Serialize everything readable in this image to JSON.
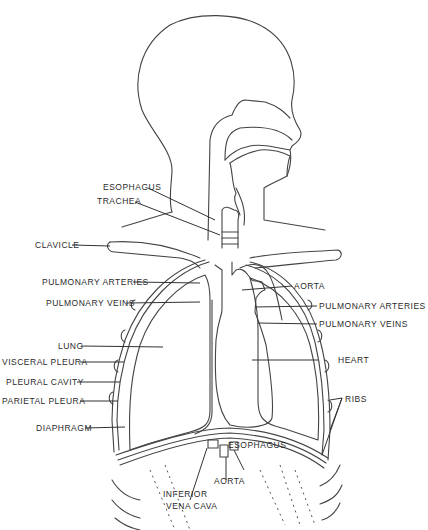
{
  "diagram": {
    "labels": {
      "esophagus_top": "ESOPHAGUS",
      "trachea": "TRACHEA",
      "clavicle": "CLAVICLE",
      "pulmonary_arteries_left": "PULMONARY ARTERIES",
      "pulmonary_veins_left": "PULMONARY VEINS",
      "lung": "LUNG",
      "visceral_pleura": "VISCERAL PLEURA",
      "pleural_cavity": "PLEURAL CAVITY",
      "parietal_pleura": "PARIETAL PLEURA",
      "diaphragm": "DIAPHRAGM",
      "aorta_top": "AORTA",
      "pulmonary_arteries_right": "PULMONARY ARTERIES",
      "pulmonary_veins_right": "PULMONARY VEINS",
      "heart": "HEART",
      "ribs": "RIBS",
      "esophagus_bottom": "ESOPHAGUS",
      "aorta_bottom": "AORTA",
      "inferior_vena_cava_1": "INFERIOR",
      "inferior_vena_cava_2": "VENA CAVA"
    },
    "colors": {
      "line": "#333333",
      "background": "#ffffff"
    }
  }
}
